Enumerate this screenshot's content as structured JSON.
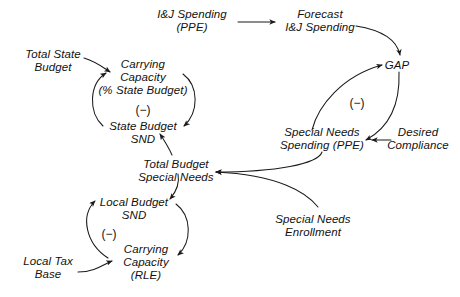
{
  "diagram": {
    "type": "causal-loop-diagram",
    "background_color": "#ffffff",
    "line_color": "#1a1a1a",
    "text_color": "#111111",
    "nodes": [
      {
        "id": "ij-spending-ppe",
        "name": "ij-spending-node",
        "lines": [
          "I&J Spending",
          "(PPE)"
        ],
        "x": 192,
        "y": 8
      },
      {
        "id": "forecast-ij-spending",
        "name": "forecast-ij-spending-node",
        "lines": [
          "Forecast",
          "I&J Spending"
        ],
        "x": 320,
        "y": 8
      },
      {
        "id": "gap",
        "name": "gap-node",
        "lines": [
          "GAP"
        ],
        "x": 397,
        "y": 59
      },
      {
        "id": "total-state-budget",
        "name": "total-state-budget-node",
        "lines": [
          "Total State",
          "Budget"
        ],
        "x": 53,
        "y": 48
      },
      {
        "id": "carrying-capacity-state",
        "name": "carrying-capacity-state-budget-node",
        "lines": [
          "Carrying",
          "Capacity",
          "(% State Budget)"
        ],
        "x": 143,
        "y": 58
      },
      {
        "id": "state-budget-snd",
        "name": "state-budget-snd-node",
        "lines": [
          "State Budget",
          "SND"
        ],
        "x": 143,
        "y": 120
      },
      {
        "id": "special-needs-spending-ppe",
        "name": "special-needs-spending-node",
        "lines": [
          "Special Needs",
          "Spending (PPE)"
        ],
        "x": 322,
        "y": 126
      },
      {
        "id": "desired-compliance",
        "name": "desired-compliance-node",
        "lines": [
          "Desired",
          "Compliance"
        ],
        "x": 418,
        "y": 126
      },
      {
        "id": "total-budget-special-needs",
        "name": "total-budget-special-needs-node",
        "lines": [
          "Total Budget",
          "Special Needs"
        ],
        "x": 176,
        "y": 158
      },
      {
        "id": "local-budget-snd",
        "name": "local-budget-snd-node",
        "lines": [
          "Local Budget",
          "SND"
        ],
        "x": 134,
        "y": 196
      },
      {
        "id": "special-needs-enrollment",
        "name": "special-needs-enrollment-node",
        "lines": [
          "Special Needs",
          "Enrollment"
        ],
        "x": 313,
        "y": 213
      },
      {
        "id": "carrying-capacity-rle",
        "name": "carrying-capacity-rle-node",
        "lines": [
          "Carrying",
          "Capacity",
          "(RLE)"
        ],
        "x": 146,
        "y": 243
      },
      {
        "id": "local-tax-base",
        "name": "local-tax-base-node",
        "lines": [
          "Local Tax",
          "Base"
        ],
        "x": 48,
        "y": 255
      }
    ],
    "polarities": [
      {
        "id": "state-loop-polarity",
        "name": "state-budget-loop-polarity",
        "label": "(−)",
        "x": 143,
        "y": 110
      },
      {
        "id": "gap-loop-polarity",
        "name": "gap-loop-polarity",
        "label": "(−)",
        "x": 357,
        "y": 103
      },
      {
        "id": "local-loop-polarity",
        "name": "local-budget-loop-polarity",
        "label": "(−)",
        "x": 109,
        "y": 234
      }
    ],
    "links": [
      {
        "id": "link-ij-to-forecast",
        "name": "link-ij-spending-to-forecast",
        "from": "ij-spending-ppe",
        "to": "forecast-ij-spending",
        "path": "M 238 22 L 275 22"
      },
      {
        "id": "link-forecast-to-gap",
        "name": "link-forecast-to-gap",
        "from": "forecast-ij-spending",
        "to": "gap",
        "path": "M 356 26 C 381 30 397 40 400 55"
      },
      {
        "id": "link-gap-to-special-needs-spending",
        "name": "link-gap-to-special-needs-spending",
        "from": "gap",
        "to": "special-needs-spending-ppe",
        "path": "M 399 72 C 400 100 392 126 366 140"
      },
      {
        "id": "link-special-needs-spending-to-gap",
        "name": "link-special-needs-spending-to-gap",
        "from": "special-needs-spending-ppe",
        "to": "gap",
        "path": "M 312 130 C 318 106 342 76 382 65"
      },
      {
        "id": "link-desired-compliance-to-spending",
        "name": "link-desired-compliance-to-special-needs-spending",
        "from": "desired-compliance",
        "to": "special-needs-spending-ppe",
        "path": "M 391 140 L 372 140"
      },
      {
        "id": "link-total-state-budget-to-carrying",
        "name": "link-total-state-budget-to-carrying-capacity",
        "from": "total-state-budget",
        "to": "carrying-capacity-state",
        "path": "M 84 58 C 97 62 104 68 110 72"
      },
      {
        "id": "link-carrying-to-state-budget-snd",
        "name": "link-carrying-capacity-to-state-budget-snd",
        "from": "carrying-capacity-state",
        "to": "state-budget-snd",
        "path": "M 183 74 C 199 86 199 112 184 126"
      },
      {
        "id": "link-state-budget-snd-to-carrying",
        "name": "link-state-budget-snd-to-carrying-capacity",
        "from": "state-budget-snd",
        "to": "carrying-capacity-state",
        "path": "M 103 126 C 88 112 89 84 106 73"
      },
      {
        "id": "link-total-budget-sn-to-state-budget-snd",
        "name": "link-total-budget-special-needs-to-state-budget-snd",
        "from": "total-budget-special-needs",
        "to": "state-budget-snd",
        "path": "M 172 155 C 168 146 164 140 160 134"
      },
      {
        "id": "link-total-budget-sn-to-local-budget-snd",
        "name": "link-total-budget-special-needs-to-local-budget-snd",
        "from": "total-budget-special-needs",
        "to": "local-budget-snd",
        "path": "M 178 174 C 180 184 176 192 170 199"
      },
      {
        "id": "link-special-needs-spending-to-total-budget",
        "name": "link-special-needs-spending-to-total-budget-special-needs",
        "from": "special-needs-spending-ppe",
        "to": "total-budget-special-needs",
        "path": "M 322 152 C 318 164 276 172 216 172"
      },
      {
        "id": "link-enrollment-to-total-budget",
        "name": "link-special-needs-enrollment-to-total-budget-special-needs",
        "from": "special-needs-enrollment",
        "to": "total-budget-special-needs",
        "path": "M 318 207 C 306 192 278 175 216 172"
      },
      {
        "id": "link-local-budget-snd-to-carrying-rle",
        "name": "link-local-budget-snd-to-carrying-capacity-rle",
        "from": "local-budget-snd",
        "to": "carrying-capacity-rle",
        "path": "M 176 204 C 192 216 192 242 178 255"
      },
      {
        "id": "link-carrying-rle-to-local-budget-snd",
        "name": "link-carrying-capacity-rle-to-local-budget-snd",
        "from": "carrying-capacity-rle",
        "to": "local-budget-snd",
        "path": "M 108 258 C 86 244 80 216 95 201"
      },
      {
        "id": "link-local-tax-base-to-carrying-rle",
        "name": "link-local-tax-base-to-carrying-capacity-rle",
        "from": "local-tax-base",
        "to": "carrying-capacity-rle",
        "path": "M 78 272 C 95 272 104 264 112 261"
      }
    ]
  }
}
